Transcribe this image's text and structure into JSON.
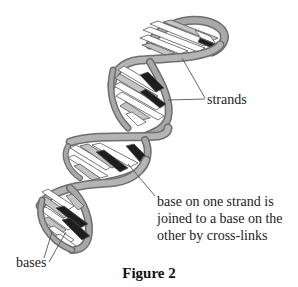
{
  "figure": {
    "caption": "Figure 2",
    "labels": {
      "strands": "strands",
      "crosslinks": [
        "base on one strand is",
        "joined to a base on the",
        "other by cross-links"
      ],
      "bases": "bases"
    },
    "colors": {
      "strand_fill": "#a8a8a8",
      "strand_edge": "#6e6e6e",
      "base_dark": "#1e1e1e",
      "base_light": "#ffffff",
      "base_grey": "#c4c4c4",
      "leader_line": "#555555"
    }
  }
}
